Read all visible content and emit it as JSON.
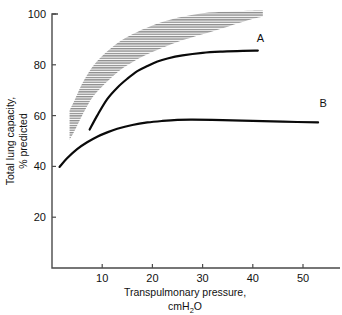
{
  "figure": {
    "background_color": "#ffffff",
    "curve_color": "#0a0a0a",
    "axis_color": "#4a4a4a",
    "band_color": "#8c8c8c"
  },
  "chart_data": {
    "type": "line",
    "title": "",
    "xlabel": "Transpulmonary pressure,",
    "xlabel_line2_prefix": "cmH",
    "xlabel_line2_sub": "2",
    "xlabel_line2_suffix": "O",
    "xlabel_full": "Transpulmonary pressure, cmH2O",
    "ylabel_line1": "Total lung capacity,",
    "ylabel_line2": "% predicted",
    "ylabel_full": "Total lung capacity, % predicted",
    "xlim": [
      0,
      55.5
    ],
    "ylim": [
      0,
      101.5
    ],
    "xticks": [
      10,
      20,
      30,
      40,
      50
    ],
    "xtick_labels": [
      "10",
      "20",
      "30",
      "40",
      "50"
    ],
    "yticks": [
      20,
      40,
      60,
      80,
      100
    ],
    "ytick_labels": [
      "20",
      "40",
      "60",
      "80",
      "100"
    ],
    "grid": false,
    "legend": "inline-end-labels",
    "series": [
      {
        "name": "A",
        "label": "A",
        "label_x": 41.5,
        "label_y": 89,
        "x": [
          7.5,
          9,
          11,
          13,
          15,
          17,
          19,
          21,
          23,
          26,
          30,
          34,
          38,
          41
        ],
        "y": [
          54.5,
          60,
          66.5,
          71,
          74.5,
          77.5,
          79.5,
          81.3,
          82.5,
          83.7,
          84.7,
          85.2,
          85.5,
          85.6
        ]
      },
      {
        "name": "B",
        "label": "B",
        "label_x": 54,
        "label_y": 63.5,
        "x": [
          1.5,
          3,
          5,
          7,
          9,
          11,
          13,
          16,
          19,
          22,
          25,
          28,
          34,
          40,
          46,
          53
        ],
        "y": [
          39.8,
          43.2,
          46.8,
          49.5,
          51.7,
          53.4,
          54.8,
          56.3,
          57.3,
          57.9,
          58.3,
          58.4,
          58.2,
          57.9,
          57.6,
          57.3
        ]
      }
    ],
    "band": {
      "name": "normal-range-band",
      "style": "horizontal-hatch",
      "x": [
        3.5,
        4.5,
        6,
        8,
        10,
        13,
        16,
        20,
        25,
        30,
        35,
        39,
        42
      ],
      "y_lower": [
        50.5,
        54,
        60,
        67,
        71.5,
        77,
        81,
        85,
        89,
        92,
        95,
        97.5,
        99
      ],
      "y_upper": [
        62,
        66,
        72.5,
        79,
        83.5,
        88.5,
        92,
        95.5,
        98.5,
        100.3,
        101,
        101.3,
        101.4
      ]
    }
  }
}
